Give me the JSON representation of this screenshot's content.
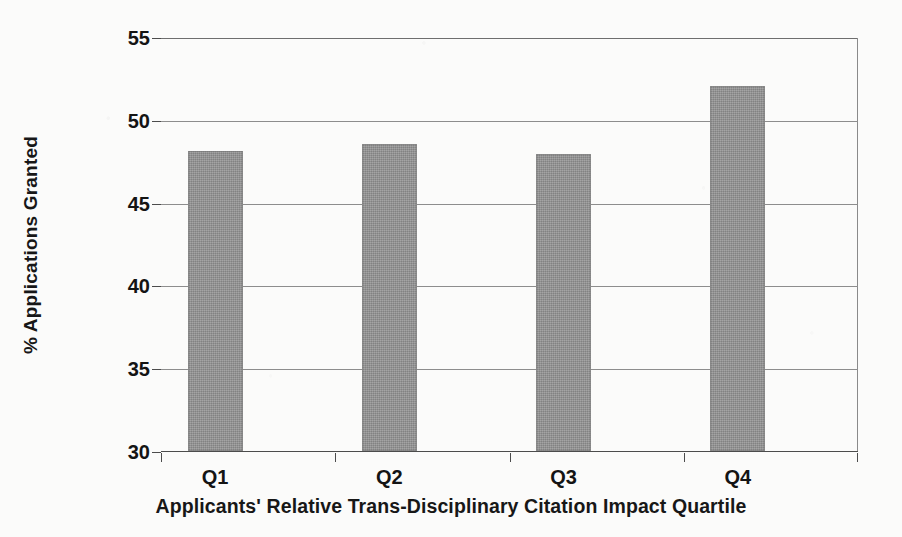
{
  "chart_data": {
    "type": "bar",
    "title": "",
    "categories": [
      "Q1",
      "Q2",
      "Q3",
      "Q4"
    ],
    "values": [
      48.2,
      48.6,
      48.0,
      52.1
    ],
    "xlabel": "Applicants' Relative Trans-Disciplinary Citation Impact Quartile",
    "ylabel": "% Applications Granted",
    "ylim": [
      30,
      55
    ],
    "yticks": [
      30,
      35,
      40,
      45,
      50,
      55
    ],
    "ytick_labels": [
      "30",
      "35",
      "40",
      "45",
      "50",
      "55"
    ],
    "grid": "horizontal",
    "legend": "none",
    "bar_color": "#909090",
    "axis_color": "#4c4c4c",
    "gridline_color": "#8d8d8d",
    "background_color": "#fbfbfa",
    "text_color": "#141414"
  }
}
